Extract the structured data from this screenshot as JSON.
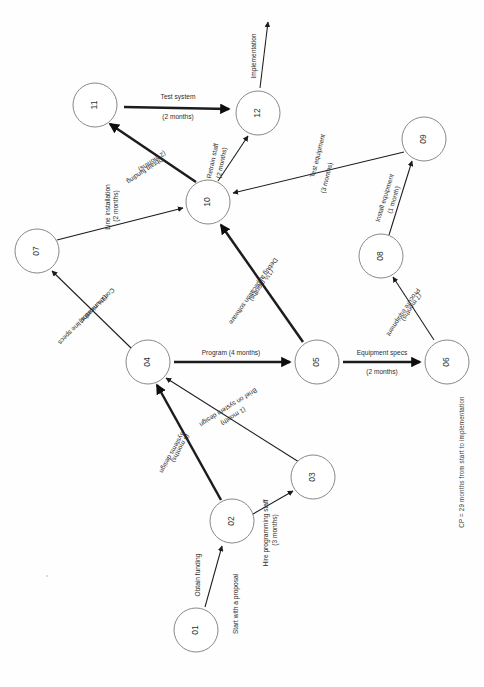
{
  "diagram": {
    "orientation_note": "rotated 90 degrees",
    "critical_path_note": "CP = 29 months from start to implementation",
    "nodes": [
      {
        "id": "01",
        "label": "01",
        "cx": 196,
        "cy": 630,
        "r": 22
      },
      {
        "id": "02",
        "label": "02",
        "cx": 232,
        "cy": 521,
        "r": 22
      },
      {
        "id": "03",
        "label": "03",
        "cx": 313,
        "cy": 477,
        "r": 22
      },
      {
        "id": "04",
        "label": "04",
        "cx": 148,
        "cy": 362,
        "r": 22
      },
      {
        "id": "05",
        "label": "05",
        "cx": 317,
        "cy": 362,
        "r": 22
      },
      {
        "id": "06",
        "label": "06",
        "cx": 447,
        "cy": 362,
        "r": 22
      },
      {
        "id": "07",
        "label": "07",
        "cx": 37,
        "cy": 251,
        "r": 22
      },
      {
        "id": "08",
        "label": "08",
        "cx": 381,
        "cy": 256,
        "r": 22
      },
      {
        "id": "09",
        "label": "09",
        "cx": 424,
        "cy": 139,
        "r": 22
      },
      {
        "id": "10",
        "label": "10",
        "cx": 208,
        "cy": 202,
        "r": 22
      },
      {
        "id": "11",
        "label": "11",
        "cx": 95,
        "cy": 105,
        "r": 22
      },
      {
        "id": "12",
        "label": "12",
        "cx": 258,
        "cy": 113,
        "r": 22
      }
    ],
    "edges": [
      {
        "name": "start-to-01",
        "from": "start",
        "to": "01",
        "task": "Start with a proposal",
        "duration": "",
        "weight": "thin",
        "label_lines": [
          "Start with a proposal"
        ]
      },
      {
        "name": "01-to-02",
        "from": "01",
        "to": "02",
        "task": "Obtain funding",
        "duration": "",
        "weight": "thick",
        "label_lines": [
          "Obtain funding"
        ]
      },
      {
        "name": "02-to-03",
        "from": "02",
        "to": "03",
        "task": "Hire programming staff",
        "duration": "(3 months)",
        "weight": "thin",
        "label_lines": [
          "Hire programming staff",
          "(3 months)"
        ]
      },
      {
        "name": "02-to-04",
        "from": "02",
        "to": "04",
        "task": "Systems design",
        "duration": "(6 months)",
        "weight": "thick",
        "label_lines": [
          "Systems design",
          "(6 months)"
        ]
      },
      {
        "name": "03-to-04",
        "from": "03",
        "to": "04",
        "task": "Brief on system design",
        "duration": "(1 month)",
        "weight": "thin",
        "label_lines": [
          "Brief on system design",
          "(1 month)"
        ]
      },
      {
        "name": "04-to-05",
        "from": "04",
        "to": "05",
        "task": "Program",
        "duration": "(4 months)",
        "weight": "thick",
        "label_lines": [
          "Program (4 months)"
        ]
      },
      {
        "name": "04-to-07",
        "from": "04",
        "to": "07",
        "task": "Communication line specs",
        "duration": "(1½ months)",
        "weight": "thin",
        "label_lines": [
          "Communication line specs",
          "(1½ months)"
        ]
      },
      {
        "name": "05-to-06",
        "from": "05",
        "to": "06",
        "task": "Equipment specs",
        "duration": "(2 months)",
        "weight": "thick",
        "label_lines": [
          "Equipment specs",
          "(2 months)"
        ]
      },
      {
        "name": "05-to-10",
        "from": "05",
        "to": "10",
        "task": "Debug application software",
        "duration": "(1½ months)",
        "weight": "thick",
        "label_lines": [
          "Debug application software",
          "(1½ months)"
        ]
      },
      {
        "name": "06-to-08",
        "from": "06",
        "to": "08",
        "task": "Procure equipment",
        "duration": "(7 months)",
        "weight": "thin",
        "label_lines": [
          "Procure equipment",
          "(7 months)"
        ]
      },
      {
        "name": "07-to-10",
        "from": "07",
        "to": "10",
        "task": "Line installation",
        "duration": "(2 months)",
        "weight": "thin",
        "label_lines": [
          "Line installation",
          "(2 months)"
        ]
      },
      {
        "name": "08-to-09",
        "from": "08",
        "to": "09",
        "task": "Install equipment",
        "duration": "(1 month)",
        "weight": "thin",
        "label_lines": [
          "Install equipment",
          "(1 month)"
        ]
      },
      {
        "name": "09-to-10",
        "from": "09",
        "to": "10",
        "task": "Test equipment",
        "duration": "(3 months)",
        "weight": "thin",
        "label_lines": [
          "Test equipment",
          "(3 months)"
        ]
      },
      {
        "name": "10-to-11",
        "from": "10",
        "to": "11",
        "task": "Obtain funding",
        "duration": "(2 months)",
        "weight": "thick",
        "label_lines": [
          "Obtain funding",
          "(2 months)"
        ]
      },
      {
        "name": "10-to-12",
        "from": "10",
        "to": "12",
        "task": "Retrain staff",
        "duration": "(2 months)",
        "weight": "thin",
        "label_lines": [
          "Retrain staff",
          "(2 months)"
        ]
      },
      {
        "name": "11-to-12",
        "from": "11",
        "to": "12",
        "task": "Test system",
        "duration": "(2 months)",
        "weight": "thick",
        "label_lines": [
          "Test system",
          "(2 months)"
        ]
      },
      {
        "name": "12-to-end",
        "from": "12",
        "to": "end",
        "task": "Implementation",
        "duration": "",
        "weight": "thin",
        "label_lines": [
          "Implementation"
        ]
      }
    ]
  },
  "labels": {
    "n01": "01",
    "n02": "02",
    "n03": "03",
    "n04": "04",
    "n05": "05",
    "n06": "06",
    "n07": "07",
    "n08": "08",
    "n09": "09",
    "n10": "10",
    "n11": "11",
    "n12": "12",
    "test_system": "Test system",
    "test_system_dur": "(2 months)",
    "implementation": "Implementation",
    "retrain_staff": "Retrain staff",
    "retrain_staff_dur": "(2 months)",
    "obtain_funding_10_11": "Obtain funding",
    "obtain_funding_10_11_dur": "(2 months)",
    "test_equipment": "Test equipment",
    "test_equipment_dur": "(3 months)",
    "install_equipment": "Install equipment",
    "install_equipment_dur": "(1 month)",
    "procure_equipment": "Procure equipment",
    "procure_equipment_dur": "(7 months)",
    "equipment_specs": "Equipment specs",
    "equipment_specs_dur": "(2 months)",
    "line_installation": "Line installation",
    "line_installation_dur": "(2 months)",
    "communication_line_specs": "Communication line specs",
    "communication_line_specs_dur": "(1½ months)",
    "debug_app_software": "Debug application software",
    "debug_app_software_dur": "(1½ months)",
    "program": "Program (4 months)",
    "brief_on_system_design": "Brief on system design",
    "brief_on_system_design_dur": "(1 month)",
    "systems_design": "Systems design",
    "systems_design_dur": "(6 months)",
    "hire_programming_staff": "Hire programming staff",
    "hire_programming_staff_dur": "(3 months)",
    "obtain_funding_01_02": "Obtain funding",
    "start_with_a_proposal": "Start with a proposal",
    "critical_path": "CP = 29 months from start to implementation"
  },
  "colors": {
    "background": "#fefefe",
    "node_stroke": "#7a7a7a",
    "edge_stroke": "#1c1c1c",
    "text": "#2d2d2d"
  }
}
